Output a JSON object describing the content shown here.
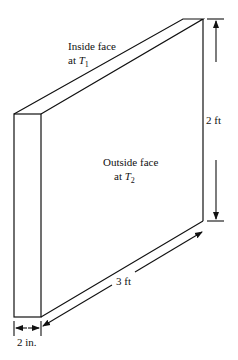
{
  "diagram": {
    "type": "plane wall (slab) isometric sketch",
    "labels": {
      "inside_face_line1": "Inside face",
      "inside_face_line2_prefix": "at ",
      "inside_face_var": "T",
      "inside_face_sub": "1",
      "outside_face_line1": "Outside face",
      "outside_face_line2_prefix": "at ",
      "outside_face_var": "T",
      "outside_face_sub": "2"
    },
    "dimensions": {
      "height": "2 ft",
      "width": "3 ft",
      "thickness": "2 in."
    },
    "colors": {
      "line": "#111111",
      "background": "#ffffff"
    }
  }
}
